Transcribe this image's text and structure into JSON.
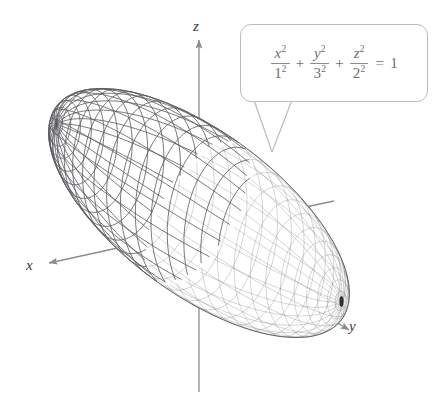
{
  "figure": {
    "background_color": "#ffffff",
    "mesh_color": "#57585c",
    "axis_color": "#8b8c90",
    "callout_border_color": "#b9bcc4",
    "equation_text_color": "#6e6e72"
  },
  "axes": {
    "z": {
      "label": "z"
    },
    "x": {
      "label": "x"
    },
    "y": {
      "label": "y"
    }
  },
  "callout": {
    "equation_plain": "x^2/1^2 + y^2/3^2 + z^2/2^2 = 1",
    "terms": [
      {
        "numerator_var": "x",
        "numerator_exp": "2",
        "denominator_base": "1",
        "denominator_exp": "2"
      },
      {
        "numerator_var": "y",
        "numerator_exp": "2",
        "denominator_base": "3",
        "denominator_exp": "2"
      },
      {
        "numerator_var": "z",
        "numerator_exp": "2",
        "denominator_base": "2",
        "denominator_exp": "2"
      }
    ],
    "operators": [
      "+",
      "+"
    ],
    "equals": "=",
    "right_hand_side": "1"
  },
  "chart_data": {
    "type": "surface",
    "equation": "x^2/1^2 + y^2/3^2 + z^2/2^2 = 1",
    "semi_axes": {
      "a_x": 1,
      "b_y": 3,
      "c_z": 2
    },
    "axis_labels": [
      "x",
      "y",
      "z"
    ],
    "mesh": {
      "u_divisions": 28,
      "v_divisions": 24
    },
    "view": {
      "projection": "oblique-perspective",
      "pole_visible_at": "positive-y"
    }
  }
}
